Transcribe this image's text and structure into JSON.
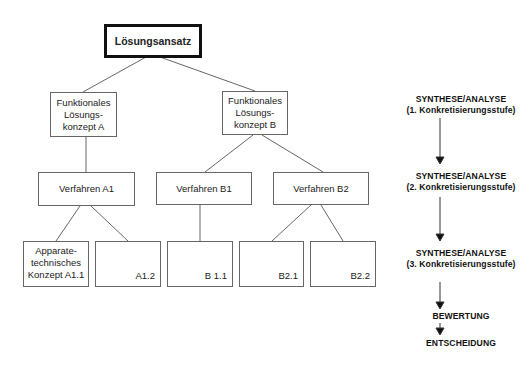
{
  "diagram": {
    "root": {
      "label": "Lösungsansatz"
    },
    "level1": [
      {
        "id": "A",
        "label": "Funktionales\nLösungs-\nkonzept  A"
      },
      {
        "id": "B",
        "label": "Funktionales\nLösungs-\nkonzept  B"
      }
    ],
    "level2": [
      {
        "id": "A1",
        "label": "Verfahren  A1",
        "parent": "A"
      },
      {
        "id": "B1",
        "label": "Verfahren  B1",
        "parent": "B"
      },
      {
        "id": "B2",
        "label": "Verfahren  B2",
        "parent": "B"
      }
    ],
    "level3": [
      {
        "id": "A1.1",
        "label": "Apparate-\ntechnisches\nKonzept  A1.1",
        "parent": "A1"
      },
      {
        "id": "A1.2",
        "label": "A1.2",
        "parent": "A1"
      },
      {
        "id": "B1.1",
        "label": "B 1.1",
        "parent": "B1"
      },
      {
        "id": "B2.1",
        "label": "B2.1",
        "parent": "B2"
      },
      {
        "id": "B2.2",
        "label": "B2.2",
        "parent": "B2"
      }
    ]
  },
  "process": {
    "stages": [
      {
        "line1": "SYNTHESE/ANALYSE",
        "line2": "(1. Konkretisierungsstufe)"
      },
      {
        "line1": "SYNTHESE/ANALYSE",
        "line2": "(2. Konkretisierungsstufe)"
      },
      {
        "line1": "SYNTHESE/ANALYSE",
        "line2": "(3. Konkretisierungsstufe)"
      },
      {
        "line1": "BEWERTUNG"
      },
      {
        "line1": "ENTSCHEIDUNG"
      }
    ]
  },
  "colors": {
    "line": "#555555",
    "text": "#222222",
    "root_border": "#111111"
  }
}
